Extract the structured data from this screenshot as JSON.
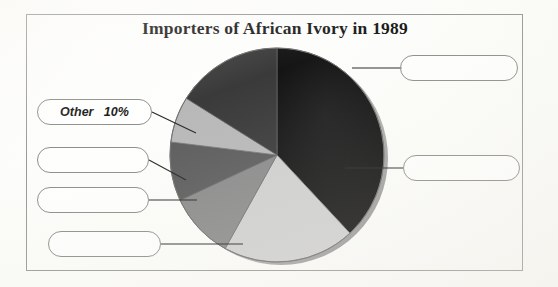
{
  "figure": {
    "title": "Importers of African Ivory in 1989",
    "frame_color": "#9a9a95",
    "paper_color": "#fdfdfb"
  },
  "chart_data": {
    "type": "pie",
    "title": "Importers of African Ivory in 1989",
    "xlabel": "",
    "ylabel": "",
    "grid": false,
    "legend_position": "callout-labels",
    "labelled_slice": {
      "label": "Other",
      "value_text": "10%",
      "value": 10
    },
    "categories": [
      "unlabelled-1",
      "unlabelled-2",
      "unlabelled-3",
      "unlabelled-4",
      "unlabelled-5",
      "Other"
    ],
    "values": [
      38,
      20,
      10,
      9,
      7,
      10
    ],
    "slices": [
      {
        "name": "unlabelled-1",
        "value": 38,
        "start_deg": 0,
        "end_deg": 137,
        "color": "#161616",
        "label_box": "callout-top-right"
      },
      {
        "name": "unlabelled-2",
        "value": 20,
        "start_deg": 137,
        "end_deg": 209,
        "color": "#cfcfcf",
        "label_box": "callout-middle-right"
      },
      {
        "name": "unlabelled-3",
        "value": 10,
        "start_deg": 209,
        "end_deg": 245,
        "color": "#8a8a8a",
        "label_box": "callout-left-4"
      },
      {
        "name": "unlabelled-4",
        "value": 9,
        "start_deg": 245,
        "end_deg": 277,
        "color": "#5c5c5c",
        "label_box": "callout-left-3"
      },
      {
        "name": "unlabelled-5",
        "value": 7,
        "start_deg": 277,
        "end_deg": 302,
        "color": "#b8b8b8",
        "label_box": "callout-left-2"
      },
      {
        "name": "Other",
        "value": 10,
        "start_deg": 302,
        "end_deg": 360,
        "color": "#3a3a3a",
        "label_box": "callout-other"
      }
    ],
    "center": {
      "x": 277,
      "y": 155
    },
    "radius": 107
  },
  "callouts": {
    "top_right": {
      "text": ""
    },
    "middle_right": {
      "text": ""
    },
    "other": {
      "text": "Other   10%"
    },
    "left_2": {
      "text": ""
    },
    "left_3": {
      "text": ""
    },
    "left_4": {
      "text": ""
    }
  }
}
